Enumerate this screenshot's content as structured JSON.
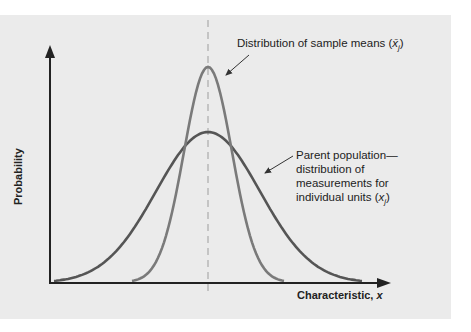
{
  "chart_data": {
    "type": "line",
    "title": "",
    "xlabel": "Characteristic, x",
    "ylabel": "Probability",
    "grid": false,
    "legend": "none (annotations used)",
    "series": [
      {
        "name": "Distribution of sample means (x̄j)",
        "shape": "normal",
        "mean": 0,
        "relative_sd": 0.45,
        "relative_peak": 1.0,
        "color": "#7a7a7a"
      },
      {
        "name": "Parent population—distribution of measurements for individual units (xj)",
        "shape": "normal",
        "mean": 0,
        "relative_sd": 1.0,
        "relative_peak": 0.7,
        "color": "#555555"
      }
    ],
    "annotations": [
      "Distribution of sample means (x̄j)",
      "Parent population— distribution of measurements for individual units (xj)",
      "dashed vertical line at common mean"
    ]
  },
  "labels": {
    "sample_means": "Distribution of sample means (",
    "sample_means_sym": "x̄",
    "sample_means_sub": "j",
    "sample_means_close": ")",
    "parent_line1": "Parent population—",
    "parent_line2": "distribution of",
    "parent_line3": "measurements for",
    "parent_line4_pre": "individual units (",
    "parent_line4_sym": "x",
    "parent_line4_sub": "j",
    "parent_line4_close": ")",
    "ylabel": "Probability",
    "xlabel": "Characteristic, ",
    "xlabel_var": "x"
  },
  "colors": {
    "panel": "#ebebeb",
    "axis": "#222222",
    "wide_curve": "#555555",
    "narrow_curve": "#7a7a7a",
    "dashed": "#b0b0b0"
  }
}
